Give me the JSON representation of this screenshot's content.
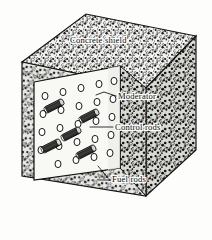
{
  "figure": {
    "style": "stippled line engraving, black and white",
    "ink_color": "#111111",
    "paper_color": "#fdfdfc"
  },
  "labels": [
    {
      "id": "concrete-shield",
      "text": "Concrete shield",
      "x": 70,
      "y": 43,
      "anchor": "start"
    },
    {
      "id": "moderator",
      "text": "Moderator",
      "x": 118,
      "y": 99,
      "anchor": "start"
    },
    {
      "id": "control-rods",
      "text": "Control rods",
      "x": 115,
      "y": 130,
      "anchor": "start"
    },
    {
      "id": "fuel-rods",
      "text": "Fuel rods",
      "x": 112,
      "y": 182,
      "anchor": "start"
    }
  ],
  "leaders": [
    {
      "id": "leader-moderator",
      "points": "116,96 104,92 96,95"
    },
    {
      "id": "leader-control-rods",
      "points": "113,127 90,127"
    },
    {
      "id": "leader-fuel-rods-a",
      "points": "110,180 99,180"
    },
    {
      "id": "leader-fuel-rods-b",
      "points": "108,178 98,166"
    }
  ],
  "cube": {
    "top_face": "22,62 86,14 196,36 146,88",
    "left_face": "22,62 146,88 146,196 22,176",
    "right_face": "146,88 196,36 196,150 146,196",
    "cutaway_face": "34,82 120,66 120,168 34,180",
    "cutaway_notch": "34,82 120,66 120,168 34,180",
    "fill_shield": "#efefec",
    "fill_cutaway": "#f7f7f4"
  },
  "chart_data": {
    "type": "diagram",
    "components": [
      {
        "name": "Concrete shield",
        "role": "outer cube of stippled concrete enclosing the core"
      },
      {
        "name": "Moderator",
        "role": "light block filling the exposed core face"
      },
      {
        "name": "Control rods",
        "role": "dark shaded cylinders inserted among the fuel rods"
      },
      {
        "name": "Fuel rods",
        "role": "open circles arranged in a lattice on the core face"
      }
    ],
    "fuel_rod_count": 24,
    "control_rod_count": 5,
    "fuel_rods": [
      {
        "x": 45,
        "y": 96
      },
      {
        "x": 63,
        "y": 92
      },
      {
        "x": 81,
        "y": 88
      },
      {
        "x": 99,
        "y": 84
      },
      {
        "x": 114,
        "y": 81
      },
      {
        "x": 43,
        "y": 114
      },
      {
        "x": 61,
        "y": 110
      },
      {
        "x": 79,
        "y": 106
      },
      {
        "x": 97,
        "y": 102
      },
      {
        "x": 113,
        "y": 99
      },
      {
        "x": 42,
        "y": 132
      },
      {
        "x": 60,
        "y": 128
      },
      {
        "x": 78,
        "y": 124
      },
      {
        "x": 96,
        "y": 121
      },
      {
        "x": 112,
        "y": 117
      },
      {
        "x": 41,
        "y": 150
      },
      {
        "x": 59,
        "y": 146
      },
      {
        "x": 77,
        "y": 142
      },
      {
        "x": 95,
        "y": 139
      },
      {
        "x": 111,
        "y": 135
      },
      {
        "x": 58,
        "y": 164
      },
      {
        "x": 76,
        "y": 160
      },
      {
        "x": 94,
        "y": 157
      },
      {
        "x": 110,
        "y": 153
      }
    ],
    "control_rods": [
      {
        "x": 54,
        "y": 106
      },
      {
        "x": 89,
        "y": 116
      },
      {
        "x": 71,
        "y": 134
      },
      {
        "x": 51,
        "y": 146
      },
      {
        "x": 86,
        "y": 152
      }
    ]
  }
}
